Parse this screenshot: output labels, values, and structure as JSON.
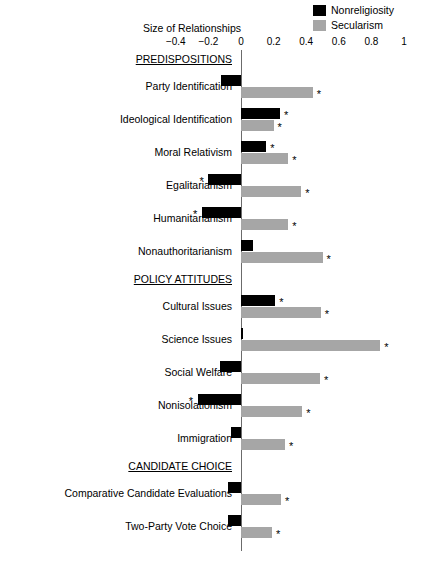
{
  "legend": {
    "items": [
      {
        "label": "Nonreligiosity",
        "color": "#000000",
        "icon": "legend-swatch-black"
      },
      {
        "label": "Secularism",
        "color": "#a6a6a6",
        "icon": "legend-swatch-gray"
      }
    ]
  },
  "axis": {
    "title": "Size of Relationships",
    "ticks": [
      "−0.4",
      "−0.2",
      "0",
      "0.2",
      "0.4",
      "0.6",
      "0.8",
      "1"
    ],
    "tick_values": [
      -0.4,
      -0.2,
      0,
      0.2,
      0.4,
      0.6,
      0.8,
      1
    ]
  },
  "chart_data": {
    "type": "bar",
    "orientation": "horizontal",
    "title": "Size of Relationships",
    "xlabel": "Size of Relationships",
    "ylabel": "",
    "xlim": [
      -0.5,
      1.0
    ],
    "grid": false,
    "legend_position": "top-right",
    "zero_reference_line": true,
    "significance_marker": "*",
    "section_headers": [
      "PREDISPOSITIONS",
      "POLICY ATTITUDES",
      "CANDIDATE CHOICE"
    ],
    "categories": [
      "Party Identification",
      "Ideological Identification",
      "Moral Relativism",
      "Egalitarianism",
      "Humanitarianism",
      "Nonauthoritarianism",
      "Cultural Issues",
      "Science Issues",
      "Social Welfare",
      "Nonisolationism",
      "Immigration",
      "Comparative Candidate Evaluations",
      "Two-Party Vote Choice"
    ],
    "series": [
      {
        "name": "Nonreligiosity",
        "color": "#000000",
        "values": [
          -0.12,
          0.24,
          0.155,
          -0.2,
          -0.24,
          0.075,
          0.21,
          0.01,
          -0.13,
          -0.265,
          -0.06,
          -0.08,
          -0.08
        ],
        "significant": [
          false,
          true,
          true,
          true,
          true,
          false,
          true,
          false,
          false,
          true,
          false,
          false,
          false
        ]
      },
      {
        "name": "Secularism",
        "color": "#a6a6a6",
        "values": [
          0.44,
          0.2,
          0.29,
          0.37,
          0.29,
          0.5,
          0.49,
          0.855,
          0.485,
          0.375,
          0.27,
          0.245,
          0.19
        ],
        "significant": [
          true,
          true,
          true,
          true,
          true,
          true,
          true,
          true,
          true,
          true,
          true,
          true,
          true
        ]
      }
    ]
  },
  "rows": [
    {
      "kind": "header",
      "label": "PREDISPOSITIONS"
    },
    {
      "kind": "data",
      "label": "Party Identification",
      "nonrel": -0.12,
      "nonrel_sig": false,
      "secul": 0.44,
      "secul_sig": true
    },
    {
      "kind": "data",
      "label": "Ideological Identification",
      "nonrel": 0.24,
      "nonrel_sig": true,
      "secul": 0.2,
      "secul_sig": true
    },
    {
      "kind": "data",
      "label": "Moral Relativism",
      "nonrel": 0.155,
      "nonrel_sig": true,
      "secul": 0.29,
      "secul_sig": true
    },
    {
      "kind": "data",
      "label": "Egalitarianism",
      "nonrel": -0.2,
      "nonrel_sig": true,
      "secul": 0.37,
      "secul_sig": true
    },
    {
      "kind": "data",
      "label": "Humanitarianism",
      "nonrel": -0.24,
      "nonrel_sig": true,
      "secul": 0.29,
      "secul_sig": true
    },
    {
      "kind": "data",
      "label": "Nonauthoritarianism",
      "nonrel": 0.075,
      "nonrel_sig": false,
      "secul": 0.5,
      "secul_sig": true
    },
    {
      "kind": "header",
      "label": "POLICY ATTITUDES"
    },
    {
      "kind": "data",
      "label": "Cultural Issues",
      "nonrel": 0.21,
      "nonrel_sig": true,
      "secul": 0.49,
      "secul_sig": true
    },
    {
      "kind": "data",
      "label": "Science Issues",
      "nonrel": 0.01,
      "nonrel_sig": false,
      "secul": 0.855,
      "secul_sig": true
    },
    {
      "kind": "data",
      "label": "Social Welfare",
      "nonrel": -0.13,
      "nonrel_sig": false,
      "secul": 0.485,
      "secul_sig": true
    },
    {
      "kind": "data",
      "label": "Nonisolationism",
      "nonrel": -0.265,
      "nonrel_sig": true,
      "secul": 0.375,
      "secul_sig": true
    },
    {
      "kind": "data",
      "label": "Immigration",
      "nonrel": -0.06,
      "nonrel_sig": false,
      "secul": 0.27,
      "secul_sig": true
    },
    {
      "kind": "header",
      "label": "CANDIDATE CHOICE"
    },
    {
      "kind": "data",
      "label": "Comparative Candidate Evaluations",
      "nonrel": -0.08,
      "nonrel_sig": false,
      "secul": 0.245,
      "secul_sig": true
    },
    {
      "kind": "data",
      "label": "Two-Party Vote Choice",
      "nonrel": -0.08,
      "nonrel_sig": false,
      "secul": 0.19,
      "secul_sig": true
    }
  ]
}
